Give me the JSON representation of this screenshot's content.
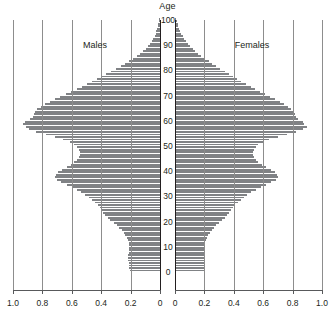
{
  "chart_data": {
    "type": "bar",
    "orientation": "population-pyramid",
    "title": "Age",
    "xlabel": "",
    "ylabel": "Age",
    "xlim": [
      0,
      1.0
    ],
    "ylim": [
      0,
      100
    ],
    "grid": true,
    "legend_position": "inside-top",
    "left_panel": {
      "name": "Males",
      "tick_labels": [
        "1.0",
        "0.8",
        "0.6",
        "0.4",
        "0.2",
        "0"
      ],
      "tick_values": [
        1.0,
        0.8,
        0.6,
        0.4,
        0.2,
        0
      ],
      "direction": "right-to-left"
    },
    "right_panel": {
      "name": "Females",
      "tick_labels": [
        "0",
        "0.2",
        "0.4",
        "0.6",
        "0.8",
        "1.0"
      ],
      "tick_values": [
        0,
        0.2,
        0.4,
        0.6,
        0.8,
        1.0
      ],
      "direction": "left-to-right"
    },
    "age_tick_labels": [
      "0",
      "10",
      "20",
      "30",
      "40",
      "50",
      "60",
      "70",
      "80",
      "90",
      "100"
    ],
    "age_tick_values": [
      0,
      10,
      20,
      30,
      40,
      50,
      60,
      70,
      80,
      90,
      100
    ],
    "ages": [
      0,
      1,
      2,
      3,
      4,
      5,
      6,
      7,
      8,
      9,
      10,
      11,
      12,
      13,
      14,
      15,
      16,
      17,
      18,
      19,
      20,
      21,
      22,
      23,
      24,
      25,
      26,
      27,
      28,
      29,
      30,
      31,
      32,
      33,
      34,
      35,
      36,
      37,
      38,
      39,
      40,
      41,
      42,
      43,
      44,
      45,
      46,
      47,
      48,
      49,
      50,
      51,
      52,
      53,
      54,
      55,
      56,
      57,
      58,
      59,
      60,
      61,
      62,
      63,
      64,
      65,
      66,
      67,
      68,
      69,
      70,
      71,
      72,
      73,
      74,
      75,
      76,
      77,
      78,
      79,
      80,
      81,
      82,
      83,
      84,
      85,
      86,
      87,
      88,
      89,
      90,
      91,
      92,
      93,
      94,
      95,
      96,
      97,
      98,
      99,
      100
    ],
    "series": [
      {
        "name": "Males",
        "values": [
          0.205,
          0.209,
          0.212,
          0.214,
          0.216,
          0.217,
          0.215,
          0.213,
          0.21,
          0.208,
          0.208,
          0.212,
          0.218,
          0.226,
          0.236,
          0.248,
          0.262,
          0.278,
          0.296,
          0.316,
          0.338,
          0.356,
          0.372,
          0.386,
          0.398,
          0.41,
          0.425,
          0.442,
          0.462,
          0.484,
          0.508,
          0.536,
          0.566,
          0.6,
          0.636,
          0.672,
          0.702,
          0.716,
          0.71,
          0.694,
          0.668,
          0.636,
          0.606,
          0.582,
          0.564,
          0.552,
          0.546,
          0.546,
          0.552,
          0.564,
          0.582,
          0.614,
          0.658,
          0.714,
          0.778,
          0.842,
          0.888,
          0.912,
          0.93,
          0.92,
          0.884,
          0.866,
          0.858,
          0.85,
          0.836,
          0.812,
          0.782,
          0.75,
          0.716,
          0.68,
          0.642,
          0.604,
          0.568,
          0.532,
          0.498,
          0.464,
          0.43,
          0.398,
          0.366,
          0.334,
          0.3,
          0.268,
          0.238,
          0.21,
          0.184,
          0.158,
          0.136,
          0.116,
          0.098,
          0.082,
          0.068,
          0.056,
          0.046,
          0.037,
          0.03,
          0.024,
          0.019,
          0.015,
          0.012,
          0.009,
          0.007
        ]
      },
      {
        "name": "Females",
        "values": [
          0.196,
          0.2,
          0.203,
          0.205,
          0.206,
          0.207,
          0.205,
          0.203,
          0.201,
          0.199,
          0.199,
          0.203,
          0.209,
          0.216,
          0.226,
          0.237,
          0.25,
          0.265,
          0.282,
          0.301,
          0.322,
          0.34,
          0.356,
          0.37,
          0.382,
          0.394,
          0.409,
          0.426,
          0.446,
          0.468,
          0.492,
          0.52,
          0.55,
          0.584,
          0.62,
          0.656,
          0.686,
          0.7,
          0.694,
          0.678,
          0.652,
          0.62,
          0.59,
          0.566,
          0.548,
          0.536,
          0.53,
          0.53,
          0.536,
          0.548,
          0.566,
          0.598,
          0.642,
          0.698,
          0.762,
          0.826,
          0.872,
          0.896,
          0.88,
          0.87,
          0.838,
          0.822,
          0.814,
          0.806,
          0.792,
          0.77,
          0.742,
          0.712,
          0.68,
          0.646,
          0.612,
          0.578,
          0.546,
          0.514,
          0.482,
          0.452,
          0.422,
          0.394,
          0.366,
          0.338,
          0.308,
          0.28,
          0.254,
          0.228,
          0.204,
          0.18,
          0.158,
          0.138,
          0.12,
          0.104,
          0.089,
          0.076,
          0.064,
          0.053,
          0.044,
          0.036,
          0.029,
          0.023,
          0.018,
          0.014,
          0.01
        ]
      }
    ]
  },
  "colors": {
    "bar": "#808285",
    "gridline": "#8d8d8d",
    "axis": "#58595b",
    "spine": "#231f20",
    "text": "#231f20",
    "background": "#ffffff"
  }
}
